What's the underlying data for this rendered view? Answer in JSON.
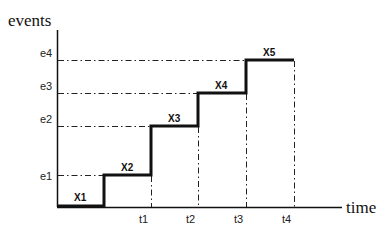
{
  "diagram": {
    "y_axis_label": "events",
    "x_axis_label": "time",
    "event_ticks": [
      "e1",
      "e2",
      "e3",
      "e4"
    ],
    "time_ticks": [
      "t1",
      "t2",
      "t3",
      "t4"
    ],
    "step_labels": [
      "X1",
      "X2",
      "X3",
      "X4",
      "X5"
    ],
    "line_color": "#111111"
  }
}
